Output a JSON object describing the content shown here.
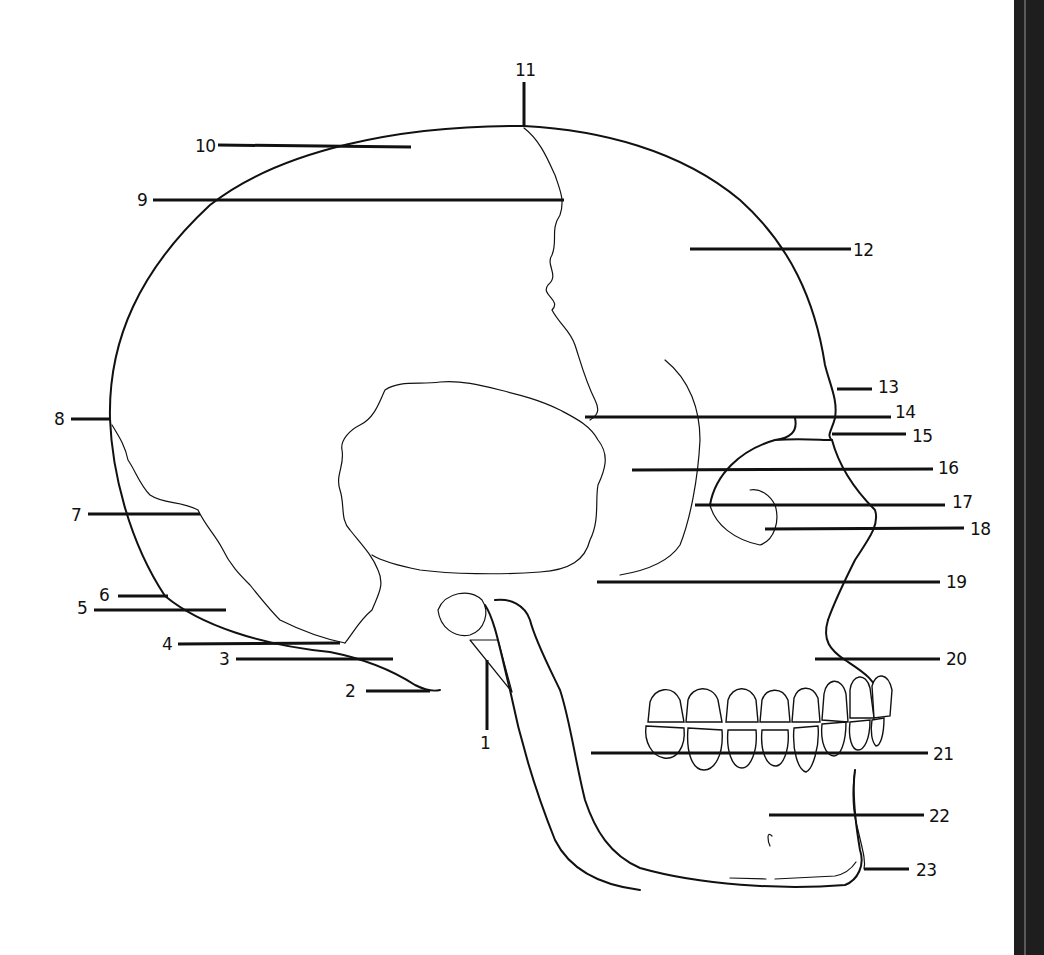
{
  "diagram": {
    "background": "#ffffff",
    "line_color": "#111111",
    "edge_bar_color": "#1e1e1e"
  },
  "labels": [
    {
      "id": "1",
      "text": "1",
      "x": 480,
      "y": 735
    },
    {
      "id": "2",
      "text": "2",
      "x": 345,
      "y": 683
    },
    {
      "id": "3",
      "text": "3",
      "x": 219,
      "y": 651
    },
    {
      "id": "4",
      "text": "4",
      "x": 162,
      "y": 636
    },
    {
      "id": "5",
      "text": "5",
      "x": 77,
      "y": 600
    },
    {
      "id": "6",
      "text": "6",
      "x": 99,
      "y": 587
    },
    {
      "id": "7",
      "text": "7",
      "x": 71,
      "y": 507
    },
    {
      "id": "8",
      "text": "8",
      "x": 54,
      "y": 411
    },
    {
      "id": "9",
      "text": "9",
      "x": 137,
      "y": 192
    },
    {
      "id": "10",
      "text": "10",
      "x": 195,
      "y": 138
    },
    {
      "id": "11",
      "text": "11",
      "x": 515,
      "y": 62
    },
    {
      "id": "12",
      "text": "12",
      "x": 853,
      "y": 242
    },
    {
      "id": "13",
      "text": "13",
      "x": 878,
      "y": 379
    },
    {
      "id": "14",
      "text": "14",
      "x": 895,
      "y": 404
    },
    {
      "id": "15",
      "text": "15",
      "x": 912,
      "y": 428
    },
    {
      "id": "16",
      "text": "16",
      "x": 938,
      "y": 460
    },
    {
      "id": "17",
      "text": "17",
      "x": 952,
      "y": 494
    },
    {
      "id": "18",
      "text": "18",
      "x": 970,
      "y": 521
    },
    {
      "id": "19",
      "text": "19",
      "x": 946,
      "y": 574
    },
    {
      "id": "20",
      "text": "20",
      "x": 946,
      "y": 651
    },
    {
      "id": "21",
      "text": "21",
      "x": 933,
      "y": 746
    },
    {
      "id": "22",
      "text": "22",
      "x": 929,
      "y": 808
    },
    {
      "id": "23",
      "text": "23",
      "x": 916,
      "y": 862
    }
  ],
  "leaders": [
    {
      "id": "1",
      "x1": 487,
      "y1": 660,
      "x2": 487,
      "y2": 730
    },
    {
      "id": "2",
      "x1": 366,
      "y1": 691,
      "x2": 430,
      "y2": 691
    },
    {
      "id": "3",
      "x1": 236,
      "y1": 659,
      "x2": 393,
      "y2": 659
    },
    {
      "id": "4",
      "x1": 178,
      "y1": 644,
      "x2": 340,
      "y2": 643
    },
    {
      "id": "5",
      "x1": 94,
      "y1": 610,
      "x2": 226,
      "y2": 610
    },
    {
      "id": "6",
      "x1": 118,
      "y1": 596,
      "x2": 168,
      "y2": 596
    },
    {
      "id": "7",
      "x1": 88,
      "y1": 514,
      "x2": 200,
      "y2": 514
    },
    {
      "id": "8",
      "x1": 71,
      "y1": 419,
      "x2": 110,
      "y2": 419
    },
    {
      "id": "9",
      "x1": 153,
      "y1": 200,
      "x2": 564,
      "y2": 200
    },
    {
      "id": "10",
      "x1": 218,
      "y1": 145,
      "x2": 411,
      "y2": 147
    },
    {
      "id": "11",
      "x1": 524,
      "y1": 82,
      "x2": 524,
      "y2": 126
    },
    {
      "id": "12",
      "x1": 690,
      "y1": 249,
      "x2": 851,
      "y2": 249
    },
    {
      "id": "13",
      "x1": 837,
      "y1": 389,
      "x2": 872,
      "y2": 389
    },
    {
      "id": "14",
      "x1": 585,
      "y1": 417,
      "x2": 891,
      "y2": 417
    },
    {
      "id": "15",
      "x1": 832,
      "y1": 434,
      "x2": 906,
      "y2": 434
    },
    {
      "id": "16",
      "x1": 632,
      "y1": 470,
      "x2": 933,
      "y2": 469
    },
    {
      "id": "17",
      "x1": 695,
      "y1": 505,
      "x2": 945,
      "y2": 505
    },
    {
      "id": "18",
      "x1": 765,
      "y1": 529,
      "x2": 964,
      "y2": 528
    },
    {
      "id": "19",
      "x1": 597,
      "y1": 582,
      "x2": 940,
      "y2": 582
    },
    {
      "id": "20",
      "x1": 815,
      "y1": 659,
      "x2": 940,
      "y2": 659
    },
    {
      "id": "21",
      "x1": 591,
      "y1": 753,
      "x2": 928,
      "y2": 753
    },
    {
      "id": "22",
      "x1": 769,
      "y1": 815,
      "x2": 924,
      "y2": 815
    },
    {
      "id": "23",
      "x1": 864,
      "y1": 869,
      "x2": 909,
      "y2": 869
    }
  ]
}
